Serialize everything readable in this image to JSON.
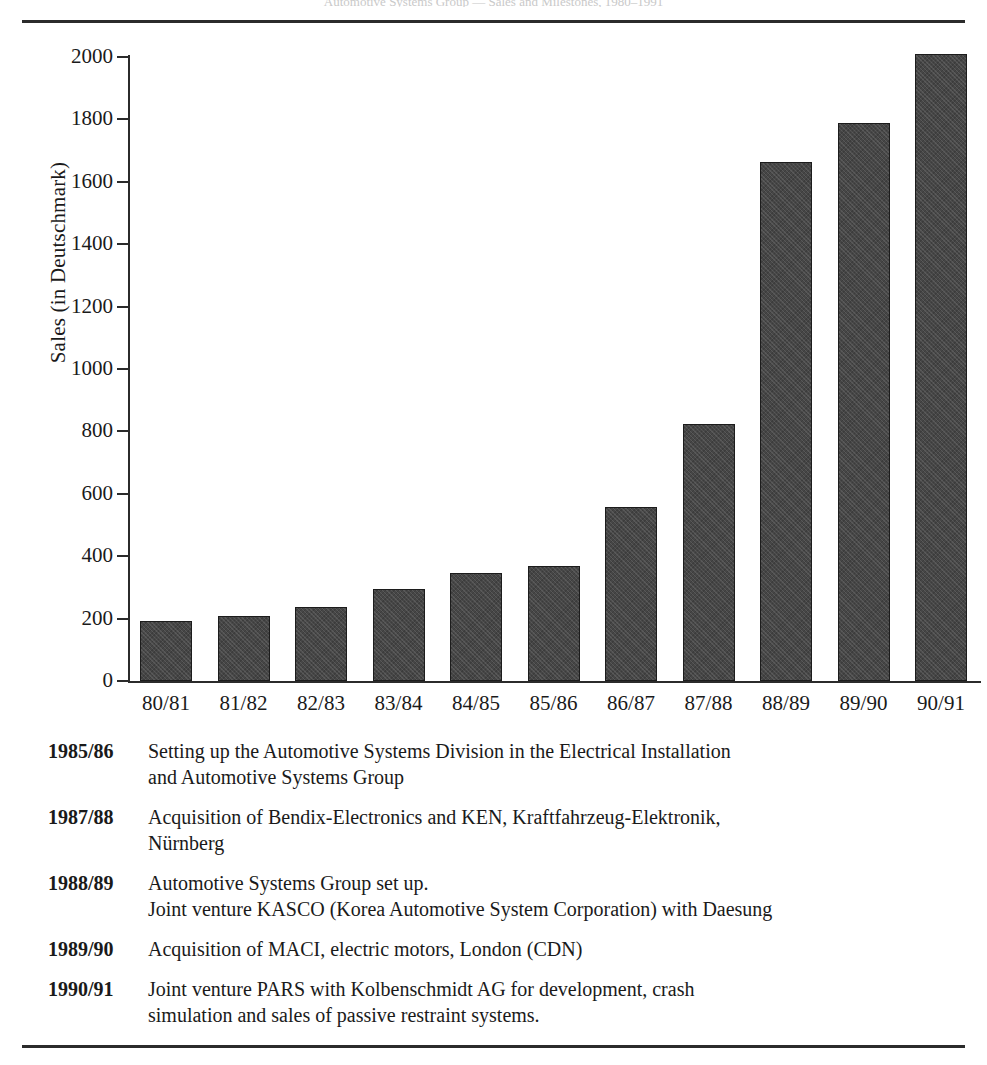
{
  "page": {
    "top_title_faint": "Automotive Systems Group — Sales and Milestones, 1980–1991"
  },
  "chart_data": {
    "type": "bar",
    "title": "",
    "xlabel": "",
    "ylabel": "Sales (in Deutschmark)",
    "categories": [
      "80/81",
      "81/82",
      "82/83",
      "83/84",
      "84/85",
      "85/86",
      "86/87",
      "87/88",
      "88/89",
      "89/90",
      "90/91"
    ],
    "values": [
      192,
      208,
      238,
      295,
      345,
      370,
      558,
      823,
      1663,
      1787,
      2010
    ],
    "ylim": [
      0,
      2000
    ],
    "yticks": [
      0,
      200,
      400,
      600,
      800,
      1000,
      1200,
      1400,
      1600,
      1800,
      2000
    ],
    "ytick_labels": [
      "0",
      "200",
      "400",
      "600",
      "800",
      "1000",
      "1200",
      "1400",
      "1600",
      "1800",
      "2000"
    ],
    "grid": false,
    "legend": null,
    "bar_color": "#464646",
    "bar_border_color": "#1c1c1c"
  },
  "milestones": [
    {
      "year": "1985/86",
      "lines": [
        "Setting up the Automotive Systems Division in the Electrical Installation",
        "and Automotive Systems Group"
      ]
    },
    {
      "year": "1987/88",
      "lines": [
        "Acquisition of Bendix-Electronics and KEN, Kraftfahrzeug-Elektronik,",
        "Nürnberg"
      ]
    },
    {
      "year": "1988/89",
      "lines": [
        "Automotive Systems Group set up.",
        "Joint venture KASCO (Korea Automotive System Corporation) with Daesung"
      ]
    },
    {
      "year": "1989/90",
      "lines": [
        "Acquisition of MACI, electric motors, London (CDN)"
      ]
    },
    {
      "year": "1990/91",
      "lines": [
        "Joint venture PARS with Kolbenschmidt AG for development, crash",
        "simulation and sales of passive restraint systems."
      ]
    }
  ]
}
